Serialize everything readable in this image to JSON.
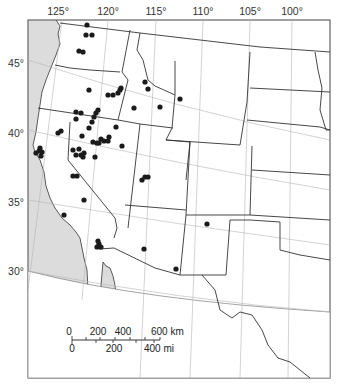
{
  "map": {
    "longitude_labels": [
      {
        "text": "125°",
        "x": 58
      },
      {
        "text": "120°",
        "x": 108
      },
      {
        "text": "115°",
        "x": 156
      },
      {
        "text": "110°",
        "x": 203
      },
      {
        "text": "105°",
        "x": 250
      },
      {
        "text": "100°",
        "x": 292
      }
    ],
    "latitude_labels": [
      {
        "text": "45°",
        "y": 63
      },
      {
        "text": "40°",
        "y": 133
      },
      {
        "text": "35°",
        "y": 202
      },
      {
        "text": "30°",
        "y": 271
      }
    ],
    "colors": {
      "water": "#dcdcdc",
      "land": "#ffffff",
      "border": "#333333",
      "graticule": "#b5b5b5",
      "point": "#1a1a1a"
    },
    "points": [
      [
        87,
        25
      ],
      [
        86,
        35
      ],
      [
        92,
        35
      ],
      [
        79,
        51
      ],
      [
        83,
        52
      ],
      [
        89,
        90
      ],
      [
        108,
        95
      ],
      [
        113,
        95
      ],
      [
        118,
        93
      ],
      [
        120,
        90
      ],
      [
        121,
        88
      ],
      [
        145,
        82
      ],
      [
        148,
        89
      ],
      [
        180,
        99
      ],
      [
        76,
        112
      ],
      [
        81,
        113
      ],
      [
        76,
        119
      ],
      [
        96,
        113
      ],
      [
        98,
        110
      ],
      [
        94,
        117
      ],
      [
        92,
        122
      ],
      [
        89,
        128
      ],
      [
        134,
        108
      ],
      [
        160,
        107
      ],
      [
        58,
        133
      ],
      [
        61,
        131
      ],
      [
        82,
        136
      ],
      [
        101,
        139
      ],
      [
        99,
        143
      ],
      [
        104,
        141
      ],
      [
        109,
        137
      ],
      [
        108,
        141
      ],
      [
        97,
        143
      ],
      [
        93,
        142
      ],
      [
        116,
        127
      ],
      [
        122,
        146
      ],
      [
        39,
        151
      ],
      [
        42,
        152
      ],
      [
        40,
        148
      ],
      [
        41,
        156
      ],
      [
        36,
        153
      ],
      [
        73,
        150
      ],
      [
        76,
        155
      ],
      [
        81,
        155
      ],
      [
        79,
        149
      ],
      [
        84,
        153
      ],
      [
        83,
        157
      ],
      [
        95,
        157
      ],
      [
        73,
        176
      ],
      [
        77,
        176
      ],
      [
        142,
        180
      ],
      [
        145,
        177
      ],
      [
        148,
        177
      ],
      [
        84,
        200
      ],
      [
        64,
        215
      ],
      [
        99,
        244
      ],
      [
        97,
        247
      ],
      [
        101,
        247
      ],
      [
        98,
        241
      ],
      [
        144,
        249
      ],
      [
        176,
        269
      ],
      [
        207,
        224
      ]
    ]
  },
  "scale_bar": {
    "km_labels": [
      "0",
      "200",
      "400",
      "600 km"
    ],
    "mi_labels": [
      "0",
      "200",
      "400 mi"
    ]
  }
}
